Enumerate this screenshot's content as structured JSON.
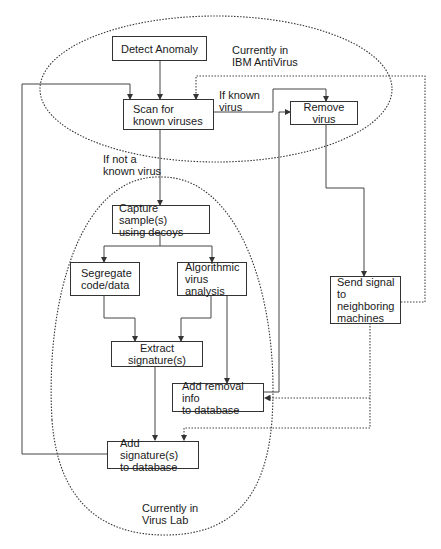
{
  "diagram": {
    "regions": [
      {
        "id": "ibm",
        "label": "Currently in\nIBM AntiVirus",
        "style": "dotted-ellipse"
      },
      {
        "id": "lab",
        "label": "Currently in\nVirus Lab",
        "style": "dotted-ellipse"
      }
    ],
    "nodes": [
      {
        "id": "detect",
        "label": "Detect Anomaly"
      },
      {
        "id": "scan",
        "label": "Scan for\nknown viruses"
      },
      {
        "id": "remove",
        "label": "Remove virus"
      },
      {
        "id": "capture",
        "label": "Capture sample(s)\nusing decoys"
      },
      {
        "id": "segregate",
        "label": "Segregate\ncode/data"
      },
      {
        "id": "algorithmic",
        "label": "Algorithmic\nvirus analysis"
      },
      {
        "id": "extract",
        "label": "Extract signature(s)"
      },
      {
        "id": "removal_info",
        "label": "Add removal info\nto database"
      },
      {
        "id": "add_sig",
        "label": "Add signature(s)\nto database"
      },
      {
        "id": "send",
        "label": "Send signal to\nneighboring\nmachines"
      }
    ],
    "edge_labels": {
      "known": "If known\nvirus",
      "not_known": "If not a\nknown virus"
    },
    "edges": [
      {
        "from": "detect",
        "to": "scan",
        "style": "solid"
      },
      {
        "from": "scan",
        "to": "remove",
        "label": "If known virus",
        "style": "solid"
      },
      {
        "from": "scan",
        "to": "capture",
        "label": "If not a known virus",
        "style": "solid"
      },
      {
        "from": "capture",
        "to": "segregate",
        "style": "solid"
      },
      {
        "from": "capture",
        "to": "algorithmic",
        "style": "solid"
      },
      {
        "from": "segregate",
        "to": "extract",
        "style": "solid"
      },
      {
        "from": "algorithmic",
        "to": "extract",
        "style": "solid"
      },
      {
        "from": "algorithmic",
        "to": "removal_info",
        "style": "solid"
      },
      {
        "from": "extract",
        "to": "add_sig",
        "style": "solid"
      },
      {
        "from": "removal_info",
        "to": "remove",
        "style": "solid"
      },
      {
        "from": "add_sig",
        "to": "scan",
        "style": "solid"
      },
      {
        "from": "remove",
        "to": "send",
        "style": "solid"
      },
      {
        "from": "send",
        "to": "scan",
        "style": "dotted"
      },
      {
        "from": "send",
        "to": "removal_info",
        "style": "dotted"
      },
      {
        "from": "send",
        "to": "add_sig",
        "style": "dotted"
      }
    ]
  }
}
